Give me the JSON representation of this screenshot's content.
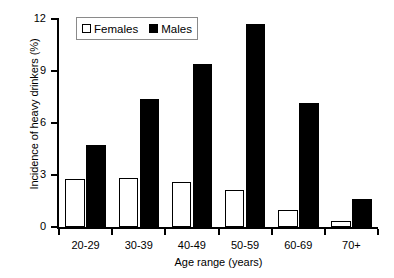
{
  "chart_data": {
    "type": "bar",
    "title": "",
    "xlabel": "Age range (years)",
    "ylabel": "Incidence of heavy drinkers (%)",
    "categories": [
      "20-29",
      "30-39",
      "40-49",
      "50-59",
      "60-69",
      "70+"
    ],
    "series": [
      {
        "name": "Females",
        "values": [
          2.75,
          2.85,
          2.6,
          2.15,
          1.0,
          0.35
        ],
        "color": "#ffffff"
      },
      {
        "name": "Males",
        "values": [
          4.75,
          7.4,
          9.4,
          11.7,
          7.15,
          1.6
        ],
        "color": "#000000"
      }
    ],
    "ylim": [
      0,
      12
    ],
    "yticks": [
      0,
      3,
      6,
      9,
      12
    ],
    "ytick_labels": [
      "0",
      "3",
      "6",
      "9",
      "12"
    ],
    "grid": false,
    "legend_position": "top-left",
    "legend_entries": [
      {
        "label": "Females",
        "swatch": "hollow-square"
      },
      {
        "label": "Males",
        "swatch": "filled-square"
      }
    ]
  }
}
